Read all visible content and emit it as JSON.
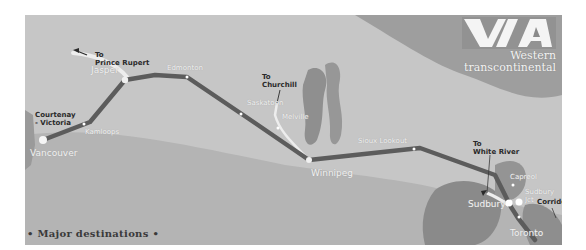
{
  "brand": {
    "logo_text": "VIA",
    "subtitle_line1": "Western",
    "subtitle_line2": "transcontinental"
  },
  "footer": {
    "title": "• Major destinations •"
  },
  "colors": {
    "background": "#c4c4c4",
    "land_dark": "#8c8c8c",
    "water": "#a8a8a8",
    "route_line": "#5a5a5a",
    "branch_line": "#ececec",
    "station_dot": "#ffffff",
    "label_white": "#f2f2f2",
    "label_dark": "#2a2a2a"
  },
  "stations": [
    {
      "name": "Vancouver",
      "type": "major"
    },
    {
      "name": "Kamloops",
      "type": "minor"
    },
    {
      "name": "Jasper",
      "type": "major"
    },
    {
      "name": "Edmonton",
      "type": "minor"
    },
    {
      "name": "Saskatoon",
      "type": "minor"
    },
    {
      "name": "Melville",
      "type": "minor"
    },
    {
      "name": "Winnipeg",
      "type": "major"
    },
    {
      "name": "Sioux Lookout",
      "type": "minor"
    },
    {
      "name": "Capreol",
      "type": "minor"
    },
    {
      "name": "Sudbury Jct",
      "type": "major"
    },
    {
      "name": "Sudbury",
      "type": "major"
    },
    {
      "name": "Toronto",
      "type": "major"
    }
  ],
  "connections": [
    {
      "label_line1": "To",
      "label_line2": "Prince Rupert"
    },
    {
      "label_line1": "To",
      "label_line2": "Churchill"
    },
    {
      "label_line1": "To",
      "label_line2": "White River"
    },
    {
      "label_line1": "Courtenay",
      "label_line2": "- Victoria"
    },
    {
      "label_line1": "Corridor",
      "label_line2": ""
    }
  ]
}
